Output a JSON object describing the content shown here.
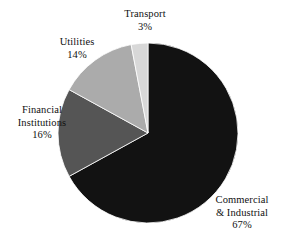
{
  "chart_data": {
    "type": "pie",
    "title": "",
    "subtitle": "",
    "xlabel": "",
    "ylabel": "",
    "legend_position": "none",
    "grid": false,
    "labels_outside": true,
    "start_angle_deg": 0,
    "direction": "clockwise",
    "categories": [
      "Commercial & Industrial",
      "Financial Institutions",
      "Utilities",
      "Transport"
    ],
    "values": [
      67,
      16,
      14,
      3
    ],
    "value_suffix": "%",
    "colors": [
      "#121212",
      "#555555",
      "#ababab",
      "#d8d8d8"
    ],
    "slices": [
      {
        "name": "Commercial & Industrial",
        "value": 67,
        "value_text": "67%",
        "label_lines": [
          "Commercial",
          "& Industrial"
        ],
        "color": "#121212"
      },
      {
        "name": "Financial Institutions",
        "value": 16,
        "value_text": "16%",
        "label_lines": [
          "Financial",
          "Institutions"
        ],
        "color": "#555555"
      },
      {
        "name": "Utilities",
        "value": 14,
        "value_text": "14%",
        "label_lines": [
          "Utilities"
        ],
        "color": "#ababab"
      },
      {
        "name": "Transport",
        "value": 3,
        "value_text": "3%",
        "label_lines": [
          "Transport"
        ],
        "color": "#d8d8d8"
      }
    ]
  },
  "geometry": {
    "center_x": 148,
    "center_y": 133,
    "radius": 90
  },
  "labels": {
    "transport": {
      "line1": "Transport",
      "value": "3%"
    },
    "utilities": {
      "line1": "Utilities",
      "value": "14%"
    },
    "financial": {
      "line1": "Financial",
      "line2": "Institutions",
      "value": "16%"
    },
    "commercial": {
      "line1": "Commercial",
      "line2": "& Industrial",
      "value": "67%"
    }
  },
  "colors": {
    "background": "#ffffff",
    "text": "#111111",
    "commercial": "#121212",
    "financial": "#555555",
    "utilities": "#ababab",
    "transport": "#d8d8d8"
  }
}
